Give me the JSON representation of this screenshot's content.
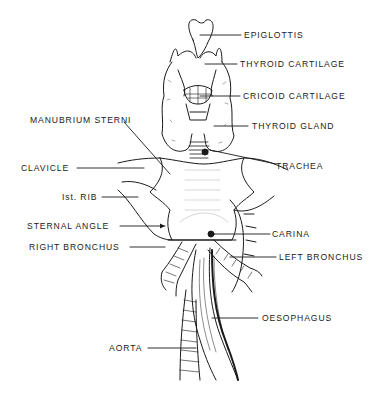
{
  "diagram": {
    "labels": {
      "epiglottis": "EPIGLOTTIS",
      "thyroid_cartilage": "THYROID CARTILAGE",
      "cricoid_cartilage": "CRICOID CARTILAGE",
      "thyroid_gland": "THYROID GLAND",
      "manubrium_sterni": "MANUBRIUM STERNI",
      "trachea": "TRACHEA",
      "clavicle": "CLAVICLE",
      "first_rib": "Ist. RIB",
      "sternal_angle": "STERNAL ANGLE",
      "carina": "CARINA",
      "right_bronchus": "RIGHT BRONCHUS",
      "left_bronchus": "LEFT BRONCHUS",
      "oesophagus": "OESOPHAGUS",
      "aorta": "AORTA"
    },
    "colors": {
      "ink": "#1a1a1a",
      "background": "#ffffff",
      "stipple": "#9a9a9a"
    }
  }
}
